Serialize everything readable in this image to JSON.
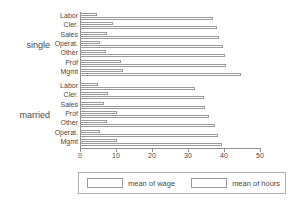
{
  "chart_data": {
    "type": "bar",
    "orientation": "horizontal",
    "title": "",
    "xlabel": "",
    "ylabel": "",
    "xlim": [
      0,
      50
    ],
    "xticks": [
      0,
      10,
      20,
      30,
      40,
      50
    ],
    "xtick_labels": [
      "0",
      "10",
      "20",
      "30",
      "40",
      "50"
    ],
    "grid": false,
    "legend_position": "bottom",
    "legend": [
      "mean of wage",
      "mean of hours"
    ],
    "series": [
      {
        "name": "mean of wage",
        "key": "wage"
      },
      {
        "name": "mean of hours",
        "key": "hours"
      }
    ],
    "groups": [
      {
        "label": "single",
        "categories": [
          "Labor",
          "Cler.",
          "Sales",
          "Operat.",
          "Other",
          "Prof",
          "Mgmt"
        ],
        "wage": [
          4.8,
          9.2,
          7.6,
          5.6,
          7.3,
          11.3,
          11.9
        ],
        "hours": [
          37.0,
          38.0,
          38.7,
          39.8,
          40.2,
          40.5,
          44.7
        ]
      },
      {
        "label": "married",
        "categories": [
          "Labor",
          "Cler.",
          "Sales",
          "Prof",
          "Other",
          "Operat.",
          "Mgmt"
        ],
        "wage": [
          5.0,
          7.9,
          6.8,
          10.4,
          7.5,
          5.6,
          10.2
        ],
        "hours": [
          32.0,
          34.5,
          34.8,
          35.9,
          37.4,
          38.4,
          39.4
        ]
      }
    ]
  },
  "legend": {
    "wage_label": "mean of wage",
    "hours_label": "mean of hours"
  }
}
